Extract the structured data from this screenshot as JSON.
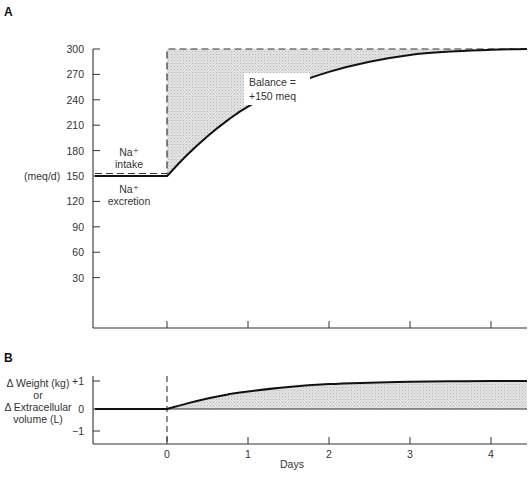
{
  "chart_data": [
    {
      "panel": "A",
      "type": "line",
      "title": "",
      "xlabel": "",
      "ylabel": "(meq/d)",
      "ylim": [
        0,
        300
      ],
      "xlim": [
        -0.9,
        4.45
      ],
      "yticks": [
        30,
        60,
        90,
        120,
        150,
        180,
        210,
        240,
        270,
        300
      ],
      "xticks": [
        0,
        1,
        2,
        3,
        4
      ],
      "xtick_labels_shown": false,
      "series": [
        {
          "name": "Na+ intake",
          "style": "dashed",
          "points": [
            [
              -0.9,
              153
            ],
            [
              0,
              153
            ],
            [
              0,
              300
            ],
            [
              4.45,
              300
            ]
          ]
        },
        {
          "name": "Na+ excretion",
          "style": "solid",
          "points": [
            [
              -0.9,
              150
            ],
            [
              0,
              150
            ],
            [
              0.25,
              175
            ],
            [
              0.5,
              197
            ],
            [
              0.75,
              216
            ],
            [
              1,
              232
            ],
            [
              1.5,
              256
            ],
            [
              2,
              273
            ],
            [
              2.5,
              285
            ],
            [
              3,
              293
            ],
            [
              3.5,
              297
            ],
            [
              4,
              299
            ],
            [
              4.45,
              300
            ]
          ]
        }
      ],
      "shaded_region": "between intake and excretion from day 0",
      "annotations": [
        {
          "text_lines": [
            "Balance =",
            "+150 meq"
          ]
        },
        {
          "text_lines": [
            "Na+",
            "intake"
          ]
        },
        {
          "text_lines": [
            "Na+",
            "excretion"
          ]
        }
      ]
    },
    {
      "panel": "B",
      "type": "line",
      "title": "",
      "xlabel": "Days",
      "ylabel_lines": [
        "Δ Weight (kg)",
        "or",
        "Δ Extracellular",
        "volume (L)"
      ],
      "ylim": [
        -1.5,
        1.2
      ],
      "xlim": [
        -0.9,
        4.45
      ],
      "yticks": [
        1,
        0,
        -1
      ],
      "ytick_labels": [
        "+1",
        "0",
        "−1"
      ],
      "xticks": [
        0,
        1,
        2,
        3,
        4
      ],
      "xtick_labels": [
        "0",
        "1",
        "2",
        "3",
        "4"
      ],
      "series": [
        {
          "name": "Δ Weight / Δ ECF volume",
          "style": "solid",
          "points": [
            [
              -0.9,
              0
            ],
            [
              0,
              0
            ],
            [
              0.25,
              0.2
            ],
            [
              0.5,
              0.38
            ],
            [
              0.75,
              0.52
            ],
            [
              1,
              0.63
            ],
            [
              1.5,
              0.79
            ],
            [
              2,
              0.89
            ],
            [
              2.5,
              0.94
            ],
            [
              3,
              0.97
            ],
            [
              3.5,
              0.99
            ],
            [
              4,
              1.0
            ],
            [
              4.45,
              1.0
            ]
          ]
        }
      ],
      "reference_lines": [
        {
          "x": 0,
          "style": "dashed"
        }
      ],
      "shaded_region": "between curve and 0 from day 0"
    }
  ],
  "labels": {
    "panel_a": "A",
    "panel_b": "B",
    "balance_line1": "Balance =",
    "balance_line2": "+150 meq",
    "intake_line1": "Na⁺",
    "intake_line2": "intake",
    "excretion_line1": "Na⁺",
    "excretion_line2": "excretion",
    "units_a": "(meq/d)",
    "ylabel_b_line1": "Δ Weight (kg)",
    "ylabel_b_line2": "or",
    "ylabel_b_line3": "Δ Extracellular",
    "ylabel_b_line4": "volume (L)",
    "xlabel_b": "Days"
  }
}
